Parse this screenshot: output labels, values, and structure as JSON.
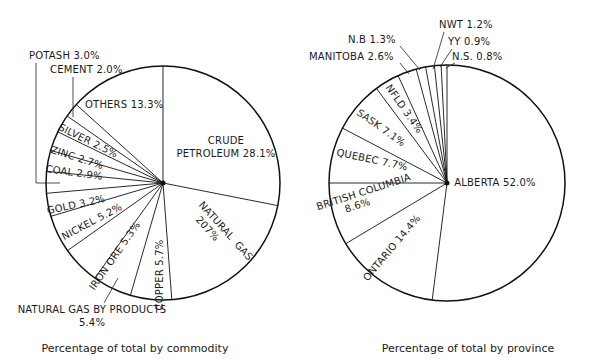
{
  "chart_data": [
    {
      "type": "pie",
      "title": "Percentage of total by commodity",
      "start_angle_deg": 0,
      "direction": "clockwise",
      "categories": [
        "Crude Petroleum",
        "Natural Gas",
        "Copper",
        "Natural Gas By Products",
        "Iron Ore",
        "Nickel",
        "Gold",
        "Potash",
        "Coal",
        "Zinc",
        "Silver",
        "Cement",
        "Others"
      ],
      "values": [
        28.1,
        20.7,
        5.7,
        5.4,
        5.3,
        5.2,
        3.2,
        3.0,
        2.9,
        2.7,
        2.5,
        2.0,
        13.3
      ],
      "labels": [
        "CRUDE PETROLEUM 28.1%",
        "NATURAL GAS 20.7%",
        "COPPER 5.7%",
        "NATURAL GAS BY PRODUCTS 5.4%",
        "IRON ORE 5.3%",
        "NICKEL 5.2%",
        "GOLD 3.2%",
        "POTASH 3.0%",
        "COAL 2.9%",
        "ZINC 2.7%",
        "SILVER 2.5%",
        "CEMENT 2.0%",
        "OTHERS 13.3%"
      ]
    },
    {
      "type": "pie",
      "title": "Percentage of total by province",
      "start_angle_deg": 0,
      "direction": "clockwise",
      "categories": [
        "Alberta",
        "Ontario",
        "British Columbia",
        "Quebec",
        "Sask",
        "Nfld",
        "Manitoba",
        "N.B.",
        "N.W.T.",
        "Y.Y.",
        "N.S."
      ],
      "values": [
        52.0,
        14.4,
        8.6,
        7.7,
        7.1,
        3.4,
        2.6,
        1.3,
        1.2,
        0.9,
        0.8
      ],
      "labels": [
        "ALBERTA 52.0%",
        "ONTARIO 14.4%",
        "BRITISH COLUMBIA 8.6%",
        "QUEBEC 7.7%",
        "SASK 7.1%",
        "NFLD 3.4%",
        "MANITOBA 2.6%",
        "N.B 1.3%",
        "NWT 1.2%",
        "YY 0.9%",
        "N.S. 0.8%"
      ]
    }
  ],
  "commodity": {
    "caption": "Percentage of total by commodity",
    "labels": {
      "crude1": "CRUDE",
      "crude2": "PETROLEUM 28.1%",
      "natgas1": "NATURAL",
      "natgas2": "GAS",
      "natgas3": "207%",
      "copper": "COPPER 5.7%",
      "ngbp1": "NATURAL GAS BY PRODUCTS",
      "ngbp2": "5.4%",
      "ironore": "IRON ORE 5.3%",
      "nickel": "NICKEL 5.2%",
      "gold": "GOLD 3.2%",
      "coal": "COAL 2.9%",
      "zinc": "ZINC 2.7%",
      "silver": "SILVER 2.5%",
      "others": "OTHERS 13.3%",
      "cement": "CEMENT 2.0%",
      "potash": "POTASH 3.0%"
    }
  },
  "province": {
    "caption": "Percentage of total by province",
    "labels": {
      "alberta": "ALBERTA 52.0%",
      "ontario": "ONTARIO 14.4%",
      "bc1": "BRITISH COLUMBIA",
      "bc2": "8.6%",
      "quebec": "QUEBEC 7.7%",
      "sask": "SASK 7.1%",
      "nfld": "NFLD 3.4%",
      "manitoba": "MANITOBA 2.6%",
      "nb": "N.B 1.3%",
      "nwt": "NWT 1.2%",
      "yy": "YY 0.9%",
      "ns": "N.S. 0.8%"
    }
  }
}
